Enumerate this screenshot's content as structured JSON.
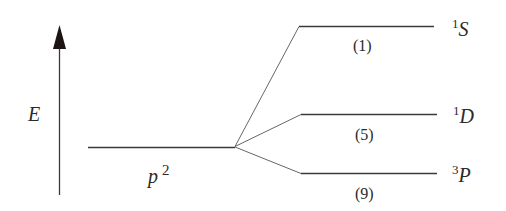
{
  "axis": {
    "label": "E"
  },
  "configuration": {
    "label": "p",
    "superscript": "2"
  },
  "levels": [
    {
      "term_multiplicity": "1",
      "term_letter": "S",
      "degeneracy": "(1)"
    },
    {
      "term_multiplicity": "1",
      "term_letter": "D",
      "degeneracy": "(5)"
    },
    {
      "term_multiplicity": "3",
      "term_letter": "P",
      "degeneracy": "(9)"
    }
  ],
  "colors": {
    "line": "#3a3a3a",
    "text": "#2a2a2a"
  }
}
